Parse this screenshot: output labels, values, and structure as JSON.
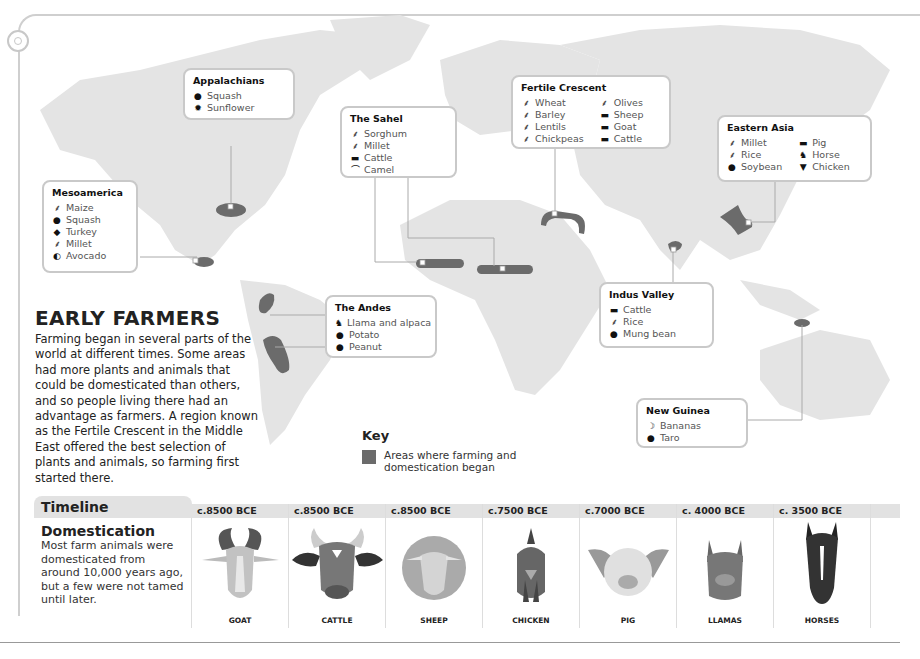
{
  "page": {
    "title": "EARLY FARMERS",
    "intro": "Farming began in several parts of the world at different times. Some areas had more plants and animals that could be domesticated than others, and so people living there had an advantage as farmers. A region known as the Fertile Crescent in the Middle East offered the best selection of plants and animals, so farming first started there."
  },
  "key": {
    "heading": "Key",
    "label": "Areas where farming and domestication began",
    "swatch_color": "#6b6b6b"
  },
  "regions": {
    "appalachians": {
      "name": "Appalachians",
      "items": [
        {
          "icon": "squash-icon",
          "label": "Squash"
        },
        {
          "icon": "sunflower-icon",
          "label": "Sunflower"
        }
      ]
    },
    "mesoamerica": {
      "name": "Mesoamerica",
      "items": [
        {
          "icon": "grain-icon",
          "label": "Maize"
        },
        {
          "icon": "squash-icon",
          "label": "Squash"
        },
        {
          "icon": "turkey-icon",
          "label": "Turkey"
        },
        {
          "icon": "grain-icon",
          "label": "Millet"
        },
        {
          "icon": "avocado-icon",
          "label": "Avocado"
        }
      ]
    },
    "sahel": {
      "name": "The Sahel",
      "items": [
        {
          "icon": "grain-icon",
          "label": "Sorghum"
        },
        {
          "icon": "grain-icon",
          "label": "Millet"
        },
        {
          "icon": "cattle-icon",
          "label": "Cattle"
        },
        {
          "icon": "camel-icon",
          "label": "Camel"
        }
      ]
    },
    "fertile_crescent": {
      "name": "Fertile Crescent",
      "items": [
        {
          "icon": "grain-icon",
          "label": "Wheat"
        },
        {
          "icon": "grain-icon",
          "label": "Barley"
        },
        {
          "icon": "grain-icon",
          "label": "Lentils"
        },
        {
          "icon": "grain-icon",
          "label": "Chickpeas"
        },
        {
          "icon": "grain-icon",
          "label": "Olives"
        },
        {
          "icon": "sheep-icon",
          "label": "Sheep"
        },
        {
          "icon": "goat-icon",
          "label": "Goat"
        },
        {
          "icon": "cattle-icon",
          "label": "Cattle"
        }
      ]
    },
    "eastern_asia": {
      "name": "Eastern Asia",
      "items": [
        {
          "icon": "grain-icon",
          "label": "Millet"
        },
        {
          "icon": "grain-icon",
          "label": "Rice"
        },
        {
          "icon": "bean-icon",
          "label": "Soybean"
        },
        {
          "icon": "pig-icon",
          "label": "Pig"
        },
        {
          "icon": "horse-icon",
          "label": "Horse"
        },
        {
          "icon": "chicken-icon",
          "label": "Chicken"
        }
      ]
    },
    "andes": {
      "name": "The Andes",
      "items": [
        {
          "icon": "llama-icon",
          "label": "Llama and alpaca"
        },
        {
          "icon": "potato-icon",
          "label": "Potato"
        },
        {
          "icon": "peanut-icon",
          "label": "Peanut"
        }
      ]
    },
    "indus_valley": {
      "name": "Indus Valley",
      "items": [
        {
          "icon": "cattle-icon",
          "label": "Cattle"
        },
        {
          "icon": "grain-icon",
          "label": "Rice"
        },
        {
          "icon": "bean-icon",
          "label": "Mung bean"
        }
      ]
    },
    "new_guinea": {
      "name": "New Guinea",
      "items": [
        {
          "icon": "banana-icon",
          "label": "Bananas"
        },
        {
          "icon": "taro-icon",
          "label": "Taro"
        }
      ]
    }
  },
  "timeline": {
    "tab": "Timeline",
    "heading": "Domestication",
    "text": "Most farm animals were domesticated from around 10,000 years ago, but a few were not tamed until later.",
    "entries": [
      {
        "date": "c.8500 BCE",
        "animal": "GOAT"
      },
      {
        "date": "c.8500 BCE",
        "animal": "CATTLE"
      },
      {
        "date": "c.8500 BCE",
        "animal": "SHEEP"
      },
      {
        "date": "c.7500 BCE",
        "animal": "CHICKEN"
      },
      {
        "date": "c.7000 BCE",
        "animal": "PIG"
      },
      {
        "date": "c. 4000 BCE",
        "animal": "LLAMAS"
      },
      {
        "date": "c. 3500 BCE",
        "animal": "HORSES"
      }
    ]
  }
}
